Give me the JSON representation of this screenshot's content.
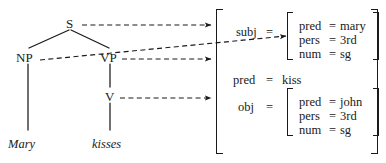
{
  "figure": {
    "kind": "lfg-correspondence-diagram"
  },
  "tree": {
    "nodes": [
      {
        "id": "S",
        "label": "S",
        "x": 68,
        "y": 21
      },
      {
        "id": "NP",
        "label": "NP",
        "x": 18,
        "y": 57
      },
      {
        "id": "VP",
        "label": "VP",
        "x": 102,
        "y": 57
      },
      {
        "id": "V",
        "label": "V",
        "x": 107,
        "y": 96
      }
    ],
    "terminals": [
      {
        "id": "Mary",
        "label": "Mary",
        "x": 8,
        "y": 144
      },
      {
        "id": "kisses",
        "label": "kisses",
        "x": 93,
        "y": 144
      }
    ],
    "edges": [
      {
        "from": "S",
        "to": "NP"
      },
      {
        "from": "S",
        "to": "VP"
      },
      {
        "from": "VP",
        "to": "V"
      },
      {
        "from": "NP",
        "to": "Mary"
      },
      {
        "from": "V",
        "to": "kisses"
      }
    ]
  },
  "correspondence_arrows": [
    {
      "from": "S",
      "to": "f-structure-root"
    },
    {
      "from": "NP",
      "to": "subj-value"
    },
    {
      "from": "VP",
      "to": "f-structure-root"
    },
    {
      "from": "V",
      "to": "obj-attribute"
    }
  ],
  "fstructure": {
    "rows": [
      {
        "attribute": "subj",
        "equals": "=",
        "value": {
          "type": "matrix",
          "rows": [
            {
              "attribute": "pred",
              "equals": "=",
              "value": "mary"
            },
            {
              "attribute": "pers",
              "equals": "=",
              "value": "3rd"
            },
            {
              "attribute": "num",
              "equals": "=",
              "value": "sg"
            }
          ]
        }
      },
      {
        "attribute": "pred",
        "equals": "=",
        "value": {
          "type": "atom",
          "text": "kiss"
        }
      },
      {
        "attribute": "obj",
        "equals": "=",
        "value": {
          "type": "matrix",
          "rows": [
            {
              "attribute": "pred",
              "equals": "=",
              "value": "john"
            },
            {
              "attribute": "pers",
              "equals": "=",
              "value": "3rd"
            },
            {
              "attribute": "num",
              "equals": "=",
              "value": "sg"
            }
          ]
        }
      }
    ]
  },
  "colors": {
    "ink": "#1a1a1a",
    "background": "#ffffff"
  }
}
